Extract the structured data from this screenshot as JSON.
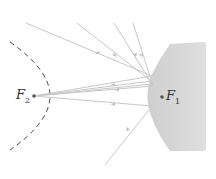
{
  "diagram": {
    "labels": {
      "f1": {
        "main": "F",
        "sub": "1"
      },
      "f2": {
        "main": "F",
        "sub": "2"
      }
    },
    "colors": {
      "ray": "#c8c8c8",
      "reflector_fill": "#d6d6d6",
      "dashed_curve": "#444444",
      "focus_dot": "#555555"
    }
  }
}
